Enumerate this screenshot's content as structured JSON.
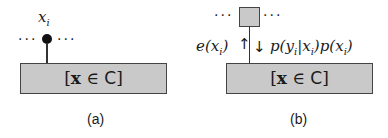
{
  "panels": [
    {
      "id": "a",
      "caption": "(a)",
      "node_label_var": "x",
      "node_label_sub": "i",
      "dots_left": "···",
      "dots_right": "···",
      "constraint_box": {
        "bracket_open": "[",
        "var": "x",
        "relation": " ∈ ",
        "set": "C",
        "bracket_close": "]"
      }
    },
    {
      "id": "b",
      "caption": "(b)",
      "dots_left": "···",
      "dots_right": "···",
      "up_message": {
        "fn": "e(",
        "var": "x",
        "sub": "i",
        "close": ")"
      },
      "down_message": {
        "p1": "p(y",
        "p1sub": "i",
        "p2": "|x",
        "p2sub": "i",
        "p3": ")p(x",
        "p3sub": "i",
        "p4": ")"
      },
      "up_arrow": "↑",
      "down_arrow": "↓",
      "constraint_box": {
        "bracket_open": "[",
        "var": "x",
        "relation": " ∈ ",
        "set": "C",
        "bracket_close": "]"
      }
    }
  ],
  "colors": {
    "box_fill": "#c9c9c9",
    "box_border": "#444444",
    "node": "#111111"
  }
}
